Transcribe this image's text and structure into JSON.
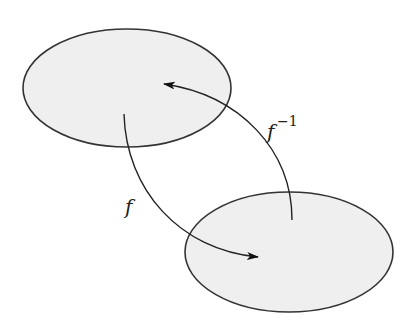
{
  "diagram": {
    "type": "function-mapping",
    "sets": [
      {
        "id": "domain",
        "shape": "ellipse",
        "cx": 127,
        "cy": 88,
        "rx": 104,
        "ry": 59,
        "fill": "#efefef",
        "stroke": "#333333"
      },
      {
        "id": "codomain",
        "shape": "ellipse",
        "cx": 289,
        "cy": 252,
        "rx": 104,
        "ry": 60,
        "fill": "#efefef",
        "stroke": "#333333"
      }
    ],
    "arrows": [
      {
        "id": "f",
        "from": "domain",
        "to": "codomain",
        "label": "f",
        "label_superscript": ""
      },
      {
        "id": "f-inverse",
        "from": "codomain",
        "to": "domain",
        "label": "f",
        "label_superscript": "−1"
      }
    ],
    "labels": {
      "f": "f",
      "f_inverse_base": "f",
      "f_inverse_superscript": "−1"
    },
    "colors": {
      "background": "#ffffff",
      "set_fill": "#efefef",
      "stroke": "#222222"
    }
  }
}
